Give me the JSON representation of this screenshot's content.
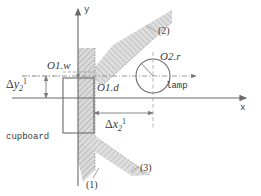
{
  "figure": {
    "axes": {
      "x_label": "x",
      "y_label": "y",
      "origin_x": 78,
      "origin_y": 98
    },
    "objects": {
      "cupboard_label": "cupboard",
      "lamp_label": "lamp",
      "width_label": "O1.w",
      "depth_label": "O1.d",
      "radius_label": "O2.r"
    },
    "dimensions": {
      "dx_label": {
        "symbol": "Δ",
        "var": "x",
        "sub": "2",
        "sup": "1"
      },
      "dy_label": {
        "symbol": "Δ",
        "var": "y",
        "sub": "2",
        "sup": "1"
      }
    },
    "wall_refs": [
      {
        "id": "wall-1",
        "label": "(1)"
      },
      {
        "id": "wall-2",
        "label": "(2)"
      },
      {
        "id": "wall-3",
        "label": "(3)"
      }
    ],
    "colors": {
      "stroke": "#6a6a6a",
      "hatch": "#a8a8a8",
      "wall_fill": "#c9c9c9",
      "text": "#3a3a3a",
      "thin": "#8c8c8c"
    }
  }
}
